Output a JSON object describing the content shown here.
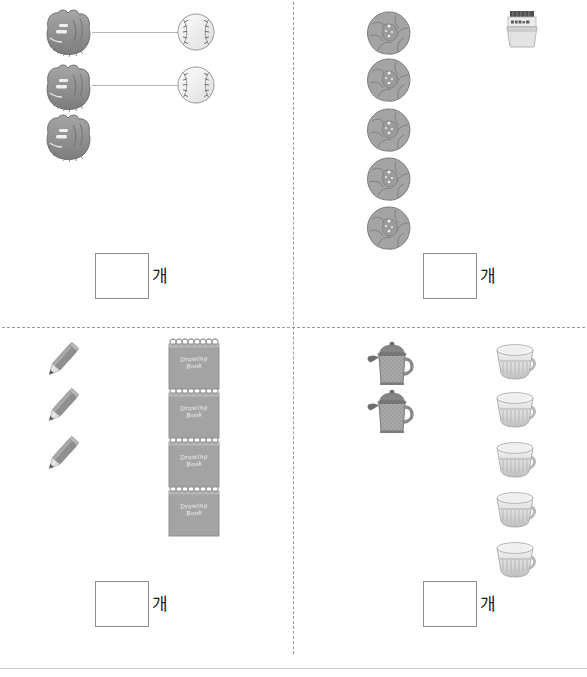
{
  "page": {
    "unit_label": "개",
    "answer_placeholder": ""
  },
  "layout": {
    "divider_color": "#9a9a9a",
    "rule_color": "#c9c9c9",
    "object_color": "#8e8e8e",
    "box_border_color": "#8c8c8c",
    "background": "#ffffff"
  },
  "quadrants": [
    {
      "id": "q1",
      "name": "baseball-gloves-and-balls",
      "groups": [
        {
          "icon": "baseball-glove-icon",
          "label": "야구 글러브",
          "count": 3
        },
        {
          "icon": "baseball-icon",
          "label": "야구공",
          "count": 2
        }
      ],
      "connectors": 2,
      "answer": {
        "value": "",
        "unit": "개"
      }
    },
    {
      "id": "q2",
      "name": "flowers-and-jar",
      "groups": [
        {
          "icon": "flower-icon",
          "label": "꽃",
          "count": 5
        },
        {
          "icon": "jar-icon",
          "label": "통",
          "count": 1
        }
      ],
      "connectors": 0,
      "answer": {
        "value": "",
        "unit": "개"
      }
    },
    {
      "id": "q3",
      "name": "pencils-and-drawing-books",
      "groups": [
        {
          "icon": "pencil-icon",
          "label": "연필",
          "count": 3
        },
        {
          "icon": "drawing-book-icon",
          "label": "스케치북",
          "count": 4
        }
      ],
      "connectors": 0,
      "answer": {
        "value": "",
        "unit": "개"
      }
    },
    {
      "id": "q4",
      "name": "teapots-and-teacups",
      "groups": [
        {
          "icon": "teapot-icon",
          "label": "주전자",
          "count": 2
        },
        {
          "icon": "teacup-icon",
          "label": "찻잔",
          "count": 5
        }
      ],
      "connectors": 0,
      "answer": {
        "value": "",
        "unit": "개"
      }
    }
  ],
  "notepad": {
    "line1": "Drawing",
    "line2": "Book"
  }
}
